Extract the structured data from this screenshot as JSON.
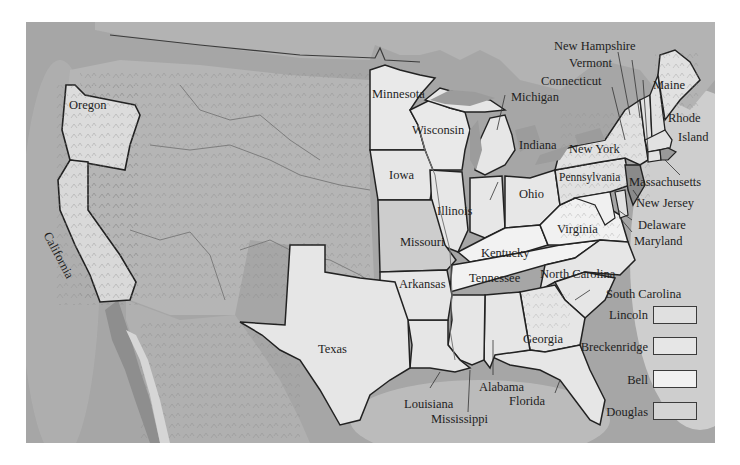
{
  "map": {
    "title": "1860 Presidential Election Map",
    "palette": {
      "ocean": "#a4a4a4",
      "territory": "#b8b8b8",
      "lincoln": "#e0e0e0",
      "breckenridge": "#e6e6e6",
      "bell": "#f1f1f1",
      "douglas": "#d4d4d4",
      "border": "#2a2a2a"
    },
    "state_labels": {
      "oregon": "Oregon",
      "california": "California",
      "minnesota": "Minnesota",
      "wisconsin": "Wisconsin",
      "michigan": "Michigan",
      "iowa": "Iowa",
      "illinois": "Illinois",
      "indiana": "Indiana",
      "ohio": "Ohio",
      "missouri": "Missouri",
      "kentucky": "Kentucky",
      "tennessee": "Tennessee",
      "arkansas": "Arkansas",
      "texas": "Texas",
      "louisiana": "Louisiana",
      "mississippi": "Mississippi",
      "alabama": "Alabama",
      "georgia": "Georgia",
      "florida": "Florida",
      "south_carolina": "South Carolina",
      "north_carolina": "North Carolina",
      "virginia": "Virginia",
      "maryland": "Maryland",
      "delaware": "Delaware",
      "new_jersey": "New Jersey",
      "pennsylvania": "Pennsylvania",
      "new_york": "New York",
      "massachusetts": "Massachusetts",
      "rhode_island_line1": "Rhode",
      "rhode_island_line2": "Island",
      "maine": "Maine",
      "connecticut": "Connecticut",
      "vermont": "Vermont",
      "new_hampshire": "New Hampshire"
    },
    "legend": [
      {
        "candidate": "Lincoln",
        "color": "#e0e0e0"
      },
      {
        "candidate": "Breckenridge",
        "color": "#e6e6e6"
      },
      {
        "candidate": "Bell",
        "color": "#f1f1f1"
      },
      {
        "candidate": "Douglas",
        "color": "#d4d4d4"
      }
    ]
  }
}
